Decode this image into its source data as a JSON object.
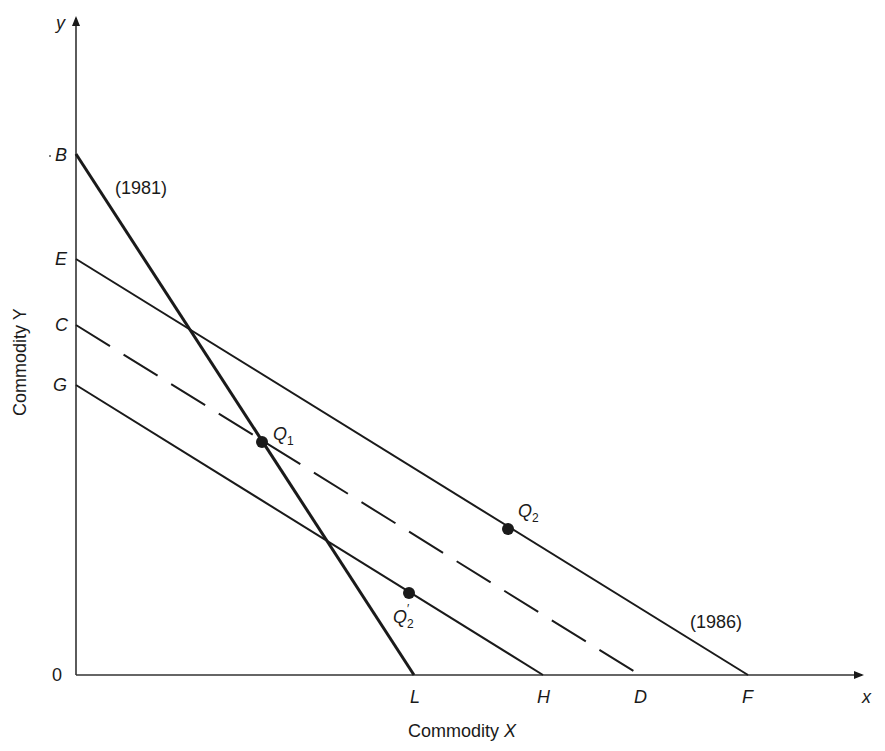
{
  "diagram": {
    "axes": {
      "y_axis_symbol": "y",
      "x_axis_symbol": "x",
      "origin_label": "0",
      "y_axis_title": "Commodity Y",
      "x_axis_title_prefix": "Commodity ",
      "x_axis_title_var": "X"
    },
    "y_intercepts": [
      "B",
      "E",
      "C",
      "G"
    ],
    "x_intercepts": [
      "L",
      "H",
      "D",
      "F"
    ],
    "lines": [
      {
        "name": "BL",
        "label": "(1981)",
        "style": "solid-thick"
      },
      {
        "name": "EF",
        "label": "(1986)",
        "style": "solid"
      },
      {
        "name": "CD",
        "label": "",
        "style": "dashed"
      },
      {
        "name": "GH",
        "label": "",
        "style": "solid"
      }
    ],
    "points": [
      {
        "name": "Q1",
        "main": "Q",
        "sub": "1",
        "prime": ""
      },
      {
        "name": "Q2",
        "main": "Q",
        "sub": "2",
        "prime": ""
      },
      {
        "name": "Q2'",
        "main": "Q",
        "sub": "2",
        "prime": "′"
      }
    ],
    "line_labels": {
      "l1981": "(1981)",
      "l1986": "(1986)"
    },
    "colors": {
      "ink": "#1a1a1a",
      "background": "#ffffff"
    }
  }
}
